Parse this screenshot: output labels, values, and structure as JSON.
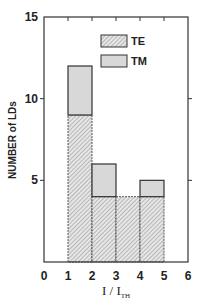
{
  "chart_data": {
    "type": "bar",
    "stacked": true,
    "title": "",
    "xlabel": "I / I_TH",
    "xlabel_main": "I / I",
    "xlabel_sub": "TH",
    "ylabel": "NUMBER of LDs",
    "xlim": [
      0,
      6
    ],
    "ylim": [
      0,
      15
    ],
    "xticks": [
      "0",
      "1",
      "2",
      "3",
      "4",
      "5",
      "6"
    ],
    "yticks": [
      "0",
      "5",
      "10",
      "15"
    ],
    "bins": [
      [
        1,
        2
      ],
      [
        2,
        3
      ],
      [
        3,
        4
      ],
      [
        4,
        5
      ]
    ],
    "categories": [
      "1-2",
      "2-3",
      "3-4",
      "4-5"
    ],
    "series": [
      {
        "name": "TE",
        "values": [
          9,
          4,
          4,
          4
        ],
        "fill": "hatched"
      },
      {
        "name": "TM",
        "values": [
          3,
          2,
          0,
          1
        ],
        "fill": "#d8d8d8"
      }
    ],
    "totals": [
      12,
      6,
      4,
      5
    ],
    "legend": {
      "position": "upper right",
      "entries": [
        "TE",
        "TM"
      ]
    },
    "grid": false
  }
}
